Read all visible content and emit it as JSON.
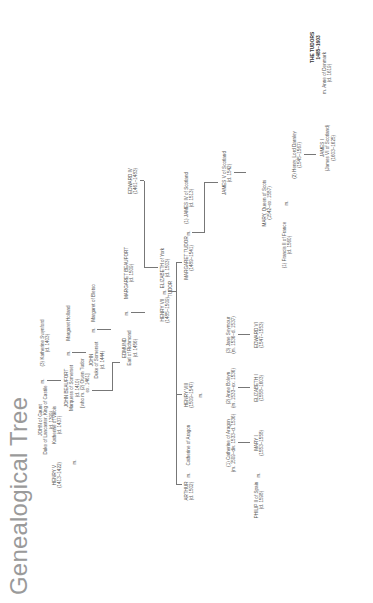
{
  "page": {
    "title": "Genealogical Tree",
    "corner_label": [
      "THE TUDORS",
      "1485–1603"
    ],
    "marriage_symbol": "m."
  },
  "people": {
    "john_of_gaunt": [
      "JOHN of Gaunt",
      "Duke of Lancaster, King of Castile",
      "(d. 1399)"
    ],
    "katherine_swynford": [
      "(3) Katherine Swynford",
      "(d. 1403)"
    ],
    "john_beaufort": [
      "JOHN BEAUFORT",
      "Marquess of Somerset",
      "(d. 1410)"
    ],
    "margaret_holland": [
      "Margaret Holland"
    ],
    "john_somerset": [
      "JOHN",
      "Duke of Somerset",
      "(d. 1444)"
    ],
    "margaret_of_bletso": [
      "Margaret of Bletso"
    ],
    "henry_v": [
      "HENRY V",
      "(1413–1422)"
    ],
    "katherine_of_valois": [
      "Katherine of Valois",
      "(d. 1437)"
    ],
    "owen_tudor": [
      "[who m. (2) Owen Tudor",
      "ex. 1461]"
    ],
    "edmund": [
      "EDMUND",
      "Earl of Richmond",
      "(d. 1456)"
    ],
    "margaret_beaufort": [
      "MARGARET BEAUFORT",
      "(d. 1509)"
    ],
    "edward_iv": [
      "EDWARD IV",
      "(1461–1483)"
    ],
    "henry_vii": [
      "HENRY VII",
      "(1485–1509)"
    ],
    "elizabeth_of_york": [
      "ELIZABETH of York",
      "(d. 1503)"
    ],
    "tudor_label": [
      "TUDOR"
    ],
    "arthur": [
      "ARTHUR",
      "(d. 1502)"
    ],
    "catherine_of_aragon_1": [
      "Catherine of Aragon"
    ],
    "henry_viii": [
      "HENRY VIII",
      "(1509–1547)"
    ],
    "margaret_tudor": [
      "MARGARET TUDOR",
      "(1489–1541)"
    ],
    "james_iv": [
      "(1) JAMES IV of Scotland",
      "(d. 1513)"
    ],
    "catherine_of_aragon_2": [
      "(1) Catherine of Aragon",
      "(m. 1509–div. 1533–d. 1536)"
    ],
    "anne_boleyn": [
      "(2) Anne Boleyn",
      "(m. 1533–ex. 1536)"
    ],
    "jane_seymour": [
      "(3) Jane Seymour",
      "(m. 1536–d. 1537)"
    ],
    "james_v": [
      "JAMES V of Scotland",
      "(d. 1542)"
    ],
    "philip_ii": [
      "PHILIP II of Spain",
      "(d. 1598)"
    ],
    "mary_i": [
      "MARY I",
      "(1553–1558)"
    ],
    "elizabeth_i": [
      "ELIZABETH I",
      "(1558–1603)"
    ],
    "edward_vi": [
      "EDWARD VI",
      "(1547–1553)"
    ],
    "francis_ii": [
      "(1) Francis II of France",
      "(d. 1560)"
    ],
    "mary_queen_of_scots": [
      "MARY, Queen of Scots",
      "(1542–ex. 1587)"
    ],
    "henry_darnley": [
      "(2) Henry, Lord Darnley",
      "(1545–1567)"
    ],
    "james_i": [
      "JAMES I",
      "(James VI of Scotland)",
      "(1603–1625)"
    ],
    "anne_of_denmark": [
      "m. Anne of Denmark",
      "(d. 1619)"
    ]
  }
}
